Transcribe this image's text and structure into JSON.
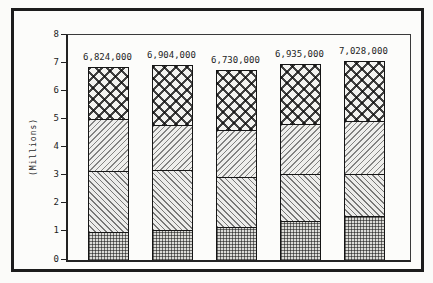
{
  "chart_data": {
    "type": "bar",
    "stacked": true,
    "title": "",
    "xlabel": "",
    "ylabel": "(Millions)",
    "ylim": [
      0,
      8
    ],
    "yticks": [
      0,
      1,
      2,
      3,
      4,
      5,
      6,
      7,
      8
    ],
    "grid": "off",
    "legend": "none",
    "x_tick_labels_visible": false,
    "categories": [
      "bar-1",
      "bar-2",
      "bar-3",
      "bar-4",
      "bar-5"
    ],
    "totals_labels": [
      "6,824,000",
      "6,904,000",
      "6,730,000",
      "6,935,000",
      "7,028,000"
    ],
    "totals_values": [
      6.824,
      6.904,
      6.73,
      6.935,
      7.028
    ],
    "series": [
      {
        "name": "bottom",
        "pattern": "dot-grid",
        "values": [
          1.05,
          1.15,
          1.25,
          1.45,
          1.62
        ]
      },
      {
        "name": "lower-middle",
        "pattern": "diagonal-backslash",
        "values": [
          2.15,
          2.1,
          1.75,
          1.65,
          1.46
        ]
      },
      {
        "name": "upper-middle",
        "pattern": "diagonal-slash",
        "values": [
          1.8,
          1.55,
          1.62,
          1.75,
          1.87
        ]
      },
      {
        "name": "top",
        "pattern": "diamond-crosshatch",
        "values": [
          1.824,
          2.104,
          2.11,
          2.085,
          2.078
        ]
      }
    ],
    "cumulative_boundaries": {
      "bar-1": [
        1.05,
        3.2,
        5.0,
        6.824
      ],
      "bar-2": [
        1.15,
        3.25,
        4.8,
        6.904
      ],
      "bar-3": [
        1.25,
        3.0,
        4.62,
        6.73
      ],
      "bar-4": [
        1.45,
        3.1,
        4.85,
        6.935
      ],
      "bar-5": [
        1.62,
        3.08,
        4.95,
        7.028
      ]
    }
  },
  "colors": {
    "line": "#1c1c1c",
    "background": "#fbfbf9",
    "hatch_ink": "#2a2a2a"
  }
}
